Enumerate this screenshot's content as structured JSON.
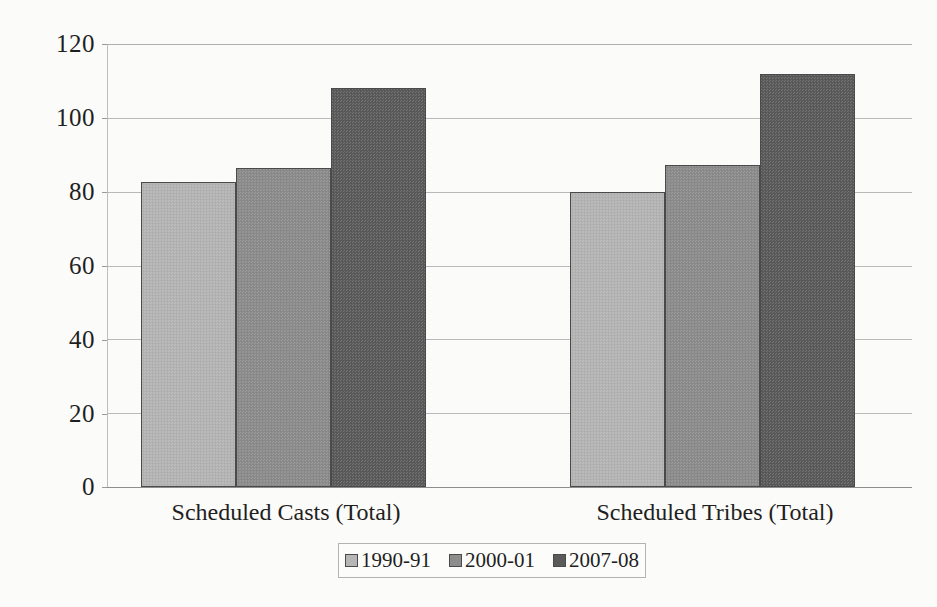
{
  "chart_data": {
    "type": "bar",
    "title": "",
    "subtitle": "",
    "xlabel": "",
    "ylabel": "",
    "categories": [
      "Scheduled Casts (Total)",
      "Scheduled Tribes (Total)"
    ],
    "series": [
      {
        "name": "1990-91",
        "color": "#b6b6b6",
        "values": [
          82.5,
          80.0
        ]
      },
      {
        "name": "2000-01",
        "color": "#8d8d8d",
        "values": [
          86.5,
          87.3
        ]
      },
      {
        "name": "2007-08",
        "color": "#5b5b5b",
        "values": [
          108.0,
          112.0
        ]
      }
    ],
    "ylim": [
      0,
      120
    ],
    "y_ticks": [
      "0",
      "20",
      "40",
      "60",
      "80",
      "100",
      "120"
    ],
    "y_tick_values": [
      0,
      20,
      40,
      60,
      80,
      100,
      120
    ],
    "grid": true,
    "grid_axis": "y",
    "legend_position": "bottom",
    "bar_gap_within_group": 0,
    "background_color": "#fbfbf9",
    "bar_border_color": "#4a4a4a",
    "gridline_color": "#b9b9b9"
  },
  "legend": {
    "items": [
      {
        "label": "1990-91",
        "swatch": "light-gray-swatch"
      },
      {
        "label": "2000-01",
        "swatch": "medium-gray-swatch"
      },
      {
        "label": "2007-08",
        "swatch": "dark-gray-swatch"
      }
    ]
  }
}
